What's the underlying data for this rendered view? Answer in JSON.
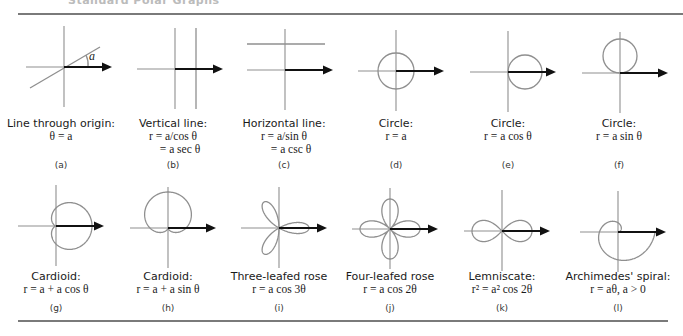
{
  "header": {
    "title": "Standard Polar Graphs"
  },
  "panels": [
    {
      "id": "a",
      "letter": "(a)",
      "caption": "Line through origin:",
      "formula_lines": [
        "θ = a"
      ],
      "graph": {
        "type": "line-through-origin",
        "origin": [
          64,
          67
        ],
        "angle_label": "a"
      }
    },
    {
      "id": "b",
      "letter": "(b)",
      "caption": "Vertical line:",
      "formula_lines": [
        "r = a/cos θ",
        "= a sec θ"
      ],
      "graph": {
        "type": "vertical-line",
        "origin": [
          175,
          69
        ],
        "a": 21
      }
    },
    {
      "id": "c",
      "letter": "(c)",
      "caption": "Horizontal line:",
      "formula_lines": [
        "r = a/sin θ",
        "= a csc θ"
      ],
      "graph": {
        "type": "horizontal-line",
        "origin": [
          285,
          70
        ],
        "a": 26
      }
    },
    {
      "id": "d",
      "letter": "(d)",
      "caption": "Circle:",
      "formula_lines": [
        "r = a"
      ],
      "graph": {
        "type": "circle",
        "origin": [
          396,
          71
        ],
        "a": 18
      }
    },
    {
      "id": "e",
      "letter": "(e)",
      "caption": "Circle:",
      "formula_lines": [
        "r = a cos θ"
      ],
      "graph": {
        "type": "circle-cos",
        "origin": [
          508,
          72
        ],
        "a": 34
      }
    },
    {
      "id": "f",
      "letter": "(f)",
      "caption": "Circle:",
      "formula_lines": [
        "r = a sin θ"
      ],
      "graph": {
        "type": "circle-sin",
        "origin": [
          620,
          73
        ],
        "a": 34
      }
    },
    {
      "id": "g",
      "letter": "(g)",
      "caption": "Cardioid:",
      "formula_lines": [
        "r = a + a cos θ"
      ],
      "graph": {
        "type": "cardioid-cos",
        "origin": [
          56,
          226
        ],
        "a": 18
      }
    },
    {
      "id": "h",
      "letter": "(h)",
      "caption": "Cardioid:",
      "formula_lines": [
        "r = a + a sin θ"
      ],
      "graph": {
        "type": "cardioid-sin",
        "origin": [
          168,
          228
        ],
        "a": 18
      }
    },
    {
      "id": "i",
      "letter": "(i)",
      "caption": "Three-leafed rose",
      "formula_lines": [
        "r = a cos 3θ"
      ],
      "graph": {
        "type": "rose3",
        "origin": [
          279,
          228
        ],
        "a": 30
      }
    },
    {
      "id": "j",
      "letter": "(j)",
      "caption": "Four-leafed rose",
      "formula_lines": [
        "r = a cos 2θ"
      ],
      "graph": {
        "type": "rose4",
        "origin": [
          390,
          229
        ],
        "a": 30
      }
    },
    {
      "id": "k",
      "letter": "(k)",
      "caption": "Lemniscate:",
      "formula_lines": [
        "r² = a² cos 2θ"
      ],
      "graph": {
        "type": "lemniscate",
        "origin": [
          502,
          231
        ],
        "a": 30
      }
    },
    {
      "id": "l",
      "letter": "(l)",
      "caption": "Archimedes' spiral:",
      "formula_lines": [
        "r = aθ, a > 0"
      ],
      "graph": {
        "type": "spiral",
        "origin": [
          618,
          232
        ],
        "a": 5.9
      }
    }
  ],
  "layout": {
    "text_top_row1": 117,
    "letter_top_row1": 160,
    "text_top_row2": 270,
    "letter_top_row2": 303,
    "panel_centers_x": [
      61,
      173,
      284,
      396,
      508,
      619,
      56,
      168,
      279,
      390,
      502,
      618
    ]
  },
  "colors": {
    "curve": "#8f8f8f",
    "axis": "#8f8f8f",
    "ray": "#111111",
    "rule": "#7a7a7a"
  }
}
